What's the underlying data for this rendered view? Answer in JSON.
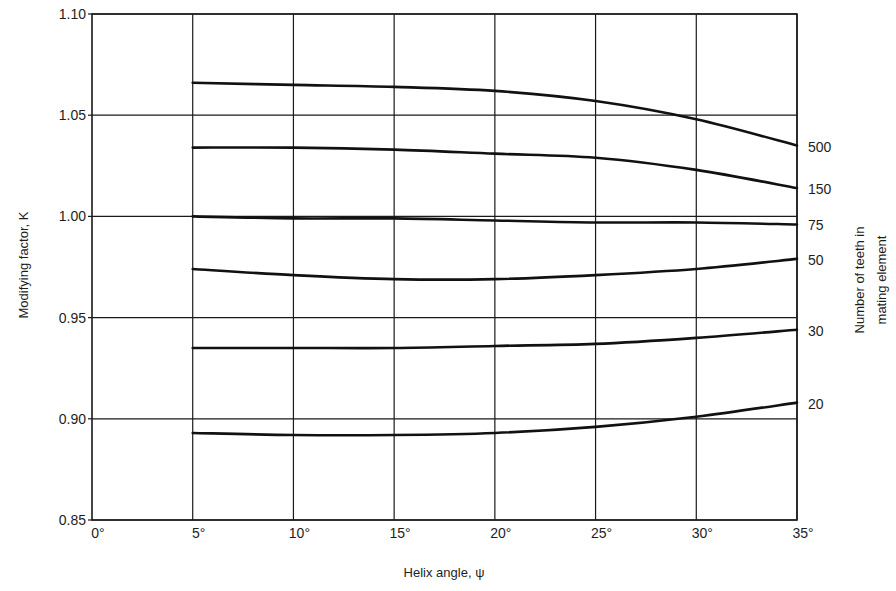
{
  "chart_data": {
    "type": "line",
    "title": "",
    "xlabel": "Helix angle, ψ",
    "ylabel": "Modifying factor, K",
    "right_label_line1": "Number of teeth in",
    "right_label_line2": "mating element",
    "xlim": [
      0,
      35
    ],
    "ylim": [
      0.85,
      1.1
    ],
    "grid": true,
    "legend_position": "right-end-labels",
    "x_ticks": [
      0,
      5,
      10,
      15,
      20,
      25,
      30,
      35
    ],
    "x_tick_labels": [
      "0°",
      "5°",
      "10°",
      "15°",
      "20°",
      "25°",
      "30°",
      "35°"
    ],
    "y_ticks": [
      0.85,
      0.9,
      0.95,
      1.0,
      1.05,
      1.1
    ],
    "y_tick_labels": [
      "0.85",
      "0.90",
      "0.95",
      "1.00",
      "1.05",
      "1.10"
    ],
    "x": [
      5,
      10,
      15,
      20,
      25,
      30,
      35
    ],
    "series": [
      {
        "name": "500",
        "values": [
          1.066,
          1.065,
          1.064,
          1.062,
          1.057,
          1.048,
          1.035
        ]
      },
      {
        "name": "150",
        "values": [
          1.034,
          1.034,
          1.033,
          1.031,
          1.029,
          1.023,
          1.014
        ]
      },
      {
        "name": "75",
        "values": [
          1.0,
          0.999,
          0.999,
          0.998,
          0.997,
          0.997,
          0.996
        ]
      },
      {
        "name": "50",
        "values": [
          0.974,
          0.971,
          0.969,
          0.969,
          0.971,
          0.974,
          0.979
        ]
      },
      {
        "name": "30",
        "values": [
          0.935,
          0.935,
          0.935,
          0.936,
          0.937,
          0.94,
          0.944
        ]
      },
      {
        "name": "20",
        "values": [
          0.893,
          0.892,
          0.892,
          0.893,
          0.896,
          0.901,
          0.908
        ]
      }
    ]
  }
}
